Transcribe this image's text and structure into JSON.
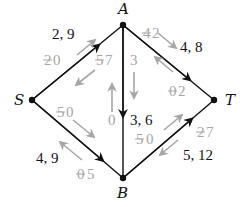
{
  "diagram": {
    "type": "flow-network",
    "nodes": [
      {
        "id": "A",
        "label": "A",
        "x": 123,
        "y": 25
      },
      {
        "id": "S",
        "label": "S",
        "x": 32,
        "y": 100
      },
      {
        "id": "T",
        "label": "T",
        "x": 214,
        "y": 100
      },
      {
        "id": "B",
        "label": "B",
        "x": 123,
        "y": 178
      }
    ],
    "edges": [
      {
        "from": "S",
        "to": "A",
        "label": "2, 9",
        "flow": 2,
        "capacity": 9,
        "residual_forward": {
          "old": "2",
          "new": "0"
        },
        "residual_backward": {
          "old": "5",
          "new": "7"
        }
      },
      {
        "from": "A",
        "to": "T",
        "label": "4, 8",
        "flow": 4,
        "capacity": 8,
        "residual_forward": {
          "old": "4",
          "new": "2"
        },
        "residual_backward": {
          "old": "0",
          "new": "2"
        }
      },
      {
        "from": "S",
        "to": "B",
        "label": "4, 9",
        "flow": 4,
        "capacity": 9,
        "residual_forward": {
          "old": "5",
          "new": "0"
        },
        "residual_backward": {
          "old": "0",
          "new": "5"
        }
      },
      {
        "from": "B",
        "to": "T",
        "label": "5, 12",
        "flow": 5,
        "capacity": 12,
        "residual_forward": {
          "old": "5",
          "new": "0"
        },
        "residual_backward": {
          "old": "2",
          "new": "7"
        }
      },
      {
        "from": "A",
        "to": "B",
        "label": "3, 6",
        "flow": 3,
        "capacity": 6,
        "residual_forward": {
          "old": "",
          "new": "3"
        },
        "residual_backward": {
          "old": "",
          "new": "0"
        }
      }
    ]
  },
  "colors": {
    "edge": "#111111",
    "residual": "#a6a6a6",
    "background": "#ffffff"
  }
}
